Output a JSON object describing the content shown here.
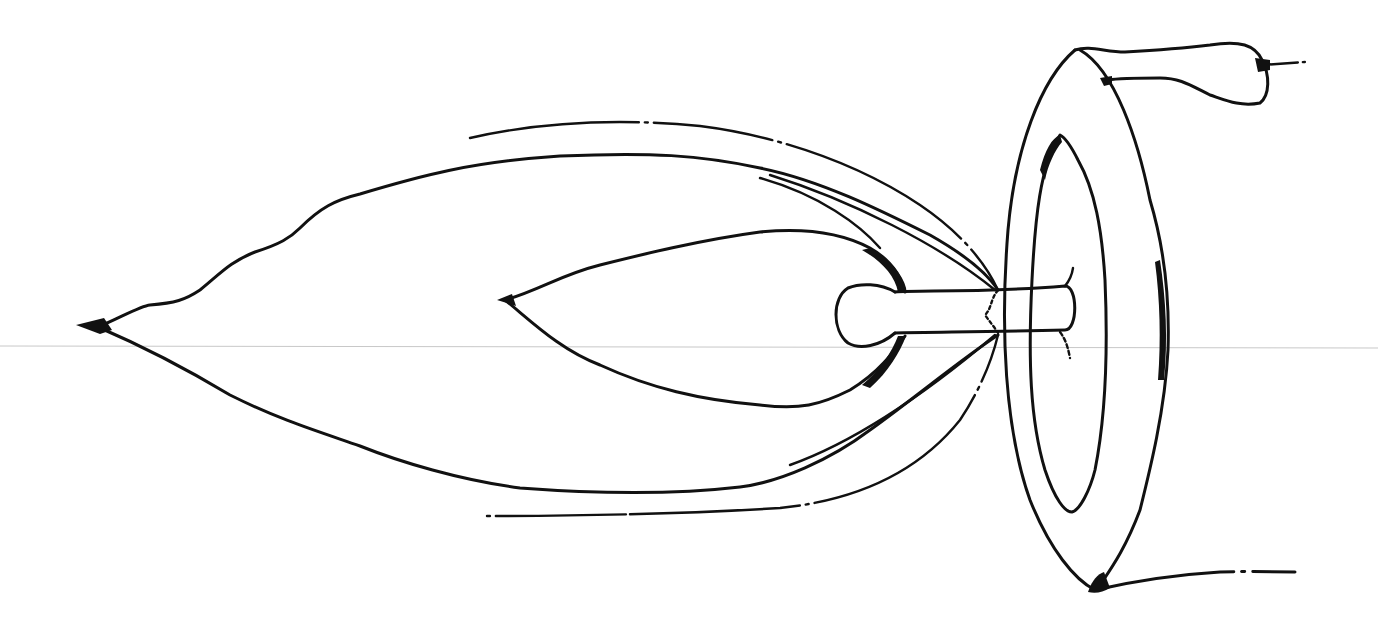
{
  "figure": {
    "colors": {
      "ink": "#111111",
      "background": "#ffffff",
      "guide_line": "#c8c8c8"
    },
    "parts": [
      {
        "id": "outer-sheath",
        "label": ""
      },
      {
        "id": "inner-sheath",
        "label": ""
      },
      {
        "id": "outer-dashed-arc-top",
        "label": ""
      },
      {
        "id": "outer-dashed-arc-bottom",
        "label": ""
      },
      {
        "id": "stalk",
        "label": ""
      },
      {
        "id": "oval-ring",
        "label": ""
      },
      {
        "id": "top-appendage",
        "label": ""
      },
      {
        "id": "bottom-tail",
        "label": ""
      },
      {
        "id": "horizontal-guide-line",
        "label": ""
      }
    ]
  }
}
